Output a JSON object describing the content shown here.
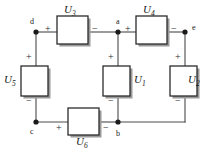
{
  "diagram": {
    "type": "electrical-circuit-schematic",
    "background_color": "#ffffff",
    "wire_color": "#4a4a4a",
    "box_stroke_color": "#2b2b2b",
    "node_color": "#1a1a1a"
  },
  "components": [
    {
      "id": "U3",
      "symbol": "U",
      "subscript": "3",
      "label": "U3",
      "orientation": "horizontal",
      "branch": "d-to-a",
      "plus": "+",
      "minus": "−",
      "plus_side": "left",
      "minus_side": "right"
    },
    {
      "id": "U4",
      "symbol": "U",
      "subscript": "4",
      "label": "U4",
      "orientation": "horizontal",
      "branch": "a-to-e",
      "plus": "+",
      "minus": "−",
      "plus_side": "left",
      "minus_side": "right"
    },
    {
      "id": "U5",
      "symbol": "U",
      "subscript": "5",
      "label": "U5",
      "orientation": "vertical",
      "branch": "d-to-c",
      "plus": "+",
      "minus": "−",
      "plus_side": "top",
      "minus_side": "bottom"
    },
    {
      "id": "U1",
      "symbol": "U",
      "subscript": "1",
      "label": "U1",
      "orientation": "vertical",
      "branch": "a-to-b",
      "plus": "+",
      "minus": "−",
      "plus_side": "top",
      "minus_side": "bottom"
    },
    {
      "id": "U2",
      "symbol": "U",
      "subscript": "2",
      "label": "U2",
      "orientation": "vertical",
      "branch": "e-to-b",
      "plus": "+",
      "minus": "−",
      "plus_side": "top",
      "minus_side": "bottom"
    },
    {
      "id": "U6",
      "symbol": "U",
      "subscript": "6",
      "label": "U6",
      "orientation": "horizontal",
      "branch": "c-to-b",
      "plus": "+",
      "minus": "−",
      "plus_side": "left",
      "minus_side": "right"
    }
  ],
  "nodes": [
    {
      "id": "d",
      "label": "d",
      "position": "top-left"
    },
    {
      "id": "a",
      "label": "a",
      "position": "top-center"
    },
    {
      "id": "e",
      "label": "e",
      "position": "top-right"
    },
    {
      "id": "c",
      "label": "c",
      "position": "bottom-left"
    },
    {
      "id": "b",
      "label": "b",
      "position": "bottom-center"
    }
  ],
  "polarity_marks": {
    "u3_plus": "+",
    "u3_minus": "−",
    "u4_plus": "+",
    "u4_minus": "−",
    "u5_plus": "+",
    "u5_minus": "−",
    "u1_plus": "+",
    "u1_minus": "−",
    "u2_plus": "+",
    "u2_minus": "−",
    "u6_plus": "+",
    "u6_minus": "−"
  }
}
